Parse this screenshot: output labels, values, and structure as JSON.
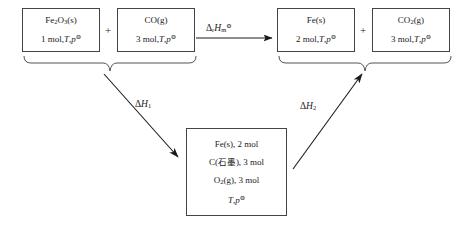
{
  "diagram": {
    "type": "thermodynamic-cycle",
    "reactants": [
      {
        "id": "fe2o3",
        "formula_html": "Fe<sub>2</sub>O<sub>3</sub>(s)",
        "formula_text": "Fe2O3(s)",
        "conditions_html": "1 mol,<span class=\"ital\">T</span>,<span class=\"ital\">p</span><sup>⊖</sup>",
        "conditions_text": "1 mol,T,p⊖",
        "amount": "1 mol"
      },
      {
        "id": "co",
        "formula_html": "CO(g)",
        "formula_text": "CO(g)",
        "conditions_html": "3 mol,<span class=\"ital\">T</span>,<span class=\"ital\">p</span><sup>⊖</sup>",
        "conditions_text": "3 mol,T,p⊖",
        "amount": "3 mol"
      }
    ],
    "products": [
      {
        "id": "fe",
        "formula_html": "Fe(s)",
        "formula_text": "Fe(s)",
        "conditions_html": "2 mol,<span class=\"ital\">T</span>,<span class=\"ital\">p</span><sup>⊖</sup>",
        "conditions_text": "2 mol,T,p⊖",
        "amount": "2 mol"
      },
      {
        "id": "co2",
        "formula_html": "CO<sub>2</sub>(g)",
        "formula_text": "CO2(g)",
        "conditions_html": "3 mol,<span class=\"ital\">T</span>,<span class=\"ital\">p</span><sup>⊖</sup>",
        "conditions_text": "3 mol,T,p⊖",
        "amount": "3 mol"
      }
    ],
    "intermediate": {
      "id": "elements-state",
      "lines_html": [
        "Fe(s), 2 mol",
        "C(<span class=\"cjk\">石墨</span>), 3 mol",
        "O<sub>2</sub>(g), 3 mol",
        "<span class=\"ital\">T</span>,<span class=\"ital\">p</span><sup>⊖</sup>"
      ],
      "lines_text": [
        "Fe(s), 2 mol",
        "C(石墨), 3 mol",
        "O2(g), 3 mol",
        "T,p⊖"
      ]
    },
    "plus_symbol": "+",
    "arrows": {
      "main": {
        "label_html": "Δ<sub>r</sub><span class=\"H\">H</span><sub>m</sub><sup>⊖</sup>",
        "label_text": "ΔrHm⊖",
        "direction": "right",
        "from": "reactants",
        "to": "products"
      },
      "down_left": {
        "label_html": "Δ<span class=\"H\">H</span><sub>1</sub>",
        "label_text": "ΔH1",
        "direction": "down-right",
        "from": "reactants",
        "to": "intermediate"
      },
      "up_right": {
        "label_html": "Δ<span class=\"H\">H</span><sub>2</sub>",
        "label_text": "ΔH2",
        "direction": "up-right",
        "from": "intermediate",
        "to": "products"
      }
    },
    "colors": {
      "stroke": "#444444",
      "text": "#1a1a1a",
      "background": "#ffffff"
    }
  }
}
